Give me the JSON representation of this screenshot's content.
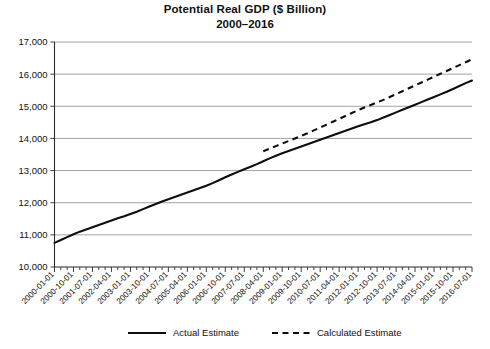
{
  "chart_data": {
    "type": "line",
    "title": "Potential Real GDP ($ Billion)",
    "subtitle": "2000–2016",
    "xlabel": "",
    "ylabel": "",
    "ylim": [
      10000,
      17000
    ],
    "ytick_values": [
      10000,
      11000,
      12000,
      13000,
      14000,
      15000,
      16000,
      17000
    ],
    "ytick_labels": [
      "10,000",
      "11,000",
      "12,000",
      "13,000",
      "14,000",
      "15,000",
      "16,000",
      "17,000"
    ],
    "grid": true,
    "grid_axis": "y",
    "legend_position": "bottom",
    "xtick_labels": [
      "2000-01-01",
      "2000-10-01",
      "2001-07-01",
      "2002-04-01",
      "2003-01-01",
      "2003-10-01",
      "2004-07-01",
      "2005-04-01",
      "2006-01-01",
      "2006-10-01",
      "2007-07-01",
      "2008-04-01",
      "2009-01-01",
      "2009-10-01",
      "2010-07-01",
      "2011-04-01",
      "2012-01-01",
      "2012-10-01",
      "2013-07-01",
      "2014-04-01",
      "2015-01-01",
      "2015-10-01",
      "2016-07-01"
    ],
    "x_quarters": [
      "2000-01-01",
      "2000-04-01",
      "2000-07-01",
      "2000-10-01",
      "2001-01-01",
      "2001-04-01",
      "2001-07-01",
      "2001-10-01",
      "2002-01-01",
      "2002-04-01",
      "2002-07-01",
      "2002-10-01",
      "2003-01-01",
      "2003-04-01",
      "2003-07-01",
      "2003-10-01",
      "2004-01-01",
      "2004-04-01",
      "2004-07-01",
      "2004-10-01",
      "2005-01-01",
      "2005-04-01",
      "2005-07-01",
      "2005-10-01",
      "2006-01-01",
      "2006-04-01",
      "2006-07-01",
      "2006-10-01",
      "2007-01-01",
      "2007-04-01",
      "2007-07-01",
      "2007-10-01",
      "2008-01-01",
      "2008-04-01",
      "2008-07-01",
      "2008-10-01",
      "2009-01-01",
      "2009-04-01",
      "2009-07-01",
      "2009-10-01",
      "2010-01-01",
      "2010-04-01",
      "2010-07-01",
      "2010-10-01",
      "2011-01-01",
      "2011-04-01",
      "2011-07-01",
      "2011-10-01",
      "2012-01-01",
      "2012-04-01",
      "2012-07-01",
      "2012-10-01",
      "2013-01-01",
      "2013-04-01",
      "2013-07-01",
      "2013-10-01",
      "2014-01-01",
      "2014-04-01",
      "2014-07-01",
      "2014-10-01",
      "2015-01-01",
      "2015-04-01",
      "2015-07-01",
      "2015-10-01",
      "2016-01-01",
      "2016-04-01",
      "2016-07-01"
    ],
    "series": [
      {
        "name": "Actual Estimate",
        "style": "solid",
        "color": "#0d0d0d",
        "start_index": 0,
        "values": [
          10750,
          10840,
          10930,
          11020,
          11100,
          11170,
          11240,
          11310,
          11380,
          11450,
          11520,
          11580,
          11650,
          11720,
          11800,
          11880,
          11960,
          12040,
          12110,
          12180,
          12250,
          12320,
          12390,
          12460,
          12530,
          12610,
          12700,
          12790,
          12880,
          12960,
          13040,
          13120,
          13200,
          13290,
          13380,
          13460,
          13540,
          13610,
          13680,
          13750,
          13820,
          13890,
          13960,
          14030,
          14100,
          14170,
          14240,
          14310,
          14380,
          14440,
          14500,
          14570,
          14650,
          14730,
          14810,
          14890,
          14970,
          15050,
          15130,
          15210,
          15290,
          15370,
          15450,
          15540,
          15630,
          15720,
          15800
        ]
      },
      {
        "name": "Calculated Estimate",
        "style": "dashed",
        "color": "#0d0d0d",
        "start_index": 33,
        "values": [
          13600,
          13680,
          13760,
          13840,
          13920,
          14000,
          14080,
          14160,
          14250,
          14340,
          14430,
          14520,
          14610,
          14700,
          14790,
          14880,
          14960,
          15040,
          15120,
          15200,
          15290,
          15380,
          15470,
          15560,
          15650,
          15740,
          15830,
          15920,
          16010,
          16100,
          16190,
          16280,
          16370,
          16460
        ]
      }
    ]
  },
  "legend": {
    "items": [
      {
        "label": "Actual Estimate",
        "style": "solid"
      },
      {
        "label": "Calculated Estimate",
        "style": "dashed"
      }
    ]
  }
}
